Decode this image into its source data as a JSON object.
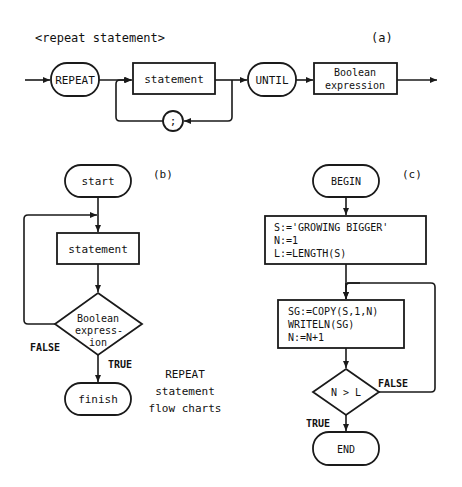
{
  "colors": {
    "ink": "#1a1a1a",
    "background": "#ffffff"
  },
  "panel_a": {
    "title": "<repeat statement>",
    "label": "(a)",
    "repeat": "REPEAT",
    "statement": "statement",
    "separator": ";",
    "until": "UNTIL",
    "boolean_line1": "Boolean",
    "boolean_line2": "expression"
  },
  "panel_b": {
    "label": "(b)",
    "start": "start",
    "statement": "statement",
    "decision_line1": "Boolean",
    "decision_line2": "express-",
    "decision_line3": "ion",
    "false_label": "FALSE",
    "true_label": "TRUE",
    "finish": "finish"
  },
  "caption": {
    "line1": "REPEAT",
    "line2": "statement",
    "line3": "flow charts"
  },
  "panel_c": {
    "label": "(c)",
    "begin": "BEGIN",
    "init_line1": "S:='GROWING BIGGER'",
    "init_line2": "N:=1",
    "init_line3": "L:=LENGTH(S)",
    "body_line1": "SG:=COPY(S,1,N)",
    "body_line2": "WRITELN(SG)",
    "body_line3": "N:=N+1",
    "decision": "N > L",
    "false_label": "FALSE",
    "true_label": "TRUE",
    "end": "END"
  }
}
